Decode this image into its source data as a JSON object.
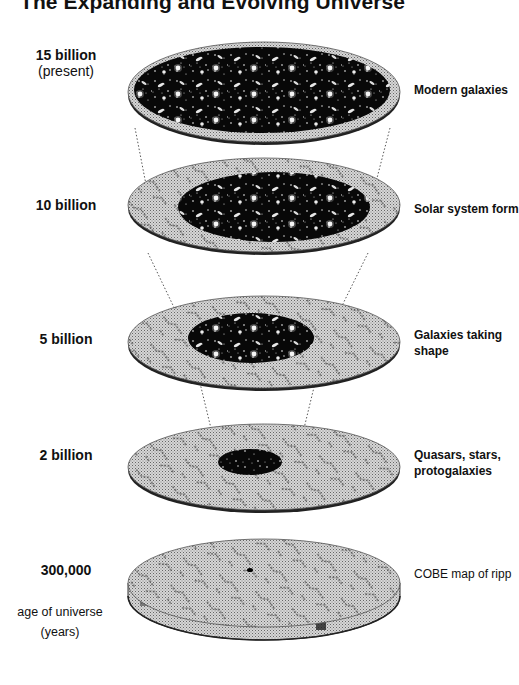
{
  "title": "The Expanding and Evolving Universe",
  "axis": {
    "label_line1": "age of universe",
    "label_line2": "(years)"
  },
  "stages": [
    {
      "age": "15 billion",
      "age_sub": "(present)",
      "description_line1": "Modern galaxies",
      "description_line2": ""
    },
    {
      "age": "10 billion",
      "age_sub": "",
      "description_line1": "Solar system form",
      "description_line2": ""
    },
    {
      "age": "5 billion",
      "age_sub": "",
      "description_line1": "Galaxies taking",
      "description_line2": "shape"
    },
    {
      "age": "2 billion",
      "age_sub": "",
      "description_line1": "Quasars, stars,",
      "description_line2": "protogalaxies"
    },
    {
      "age": "300,000",
      "age_sub": "",
      "description_line1": "COBE map of ripp",
      "description_line2": ""
    }
  ],
  "colors": {
    "disk_gray": "#c4c4c4",
    "disk_edge": "#3a3a3a",
    "space": "#0a0a0a",
    "text": "#111111"
  }
}
